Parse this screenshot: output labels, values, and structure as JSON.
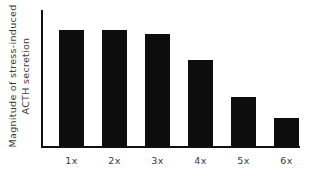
{
  "chart_data": {
    "type": "bar",
    "title": "",
    "subtitle": "",
    "xlabel": "",
    "ylabel": "Magnitude of stress-induced ACTH secretion",
    "ylabel_lines": [
      "Magnitude of stress-induced",
      "ACTH secretion"
    ],
    "categories": [
      "1x",
      "2x",
      "3x",
      "4x",
      "5x",
      "6x"
    ],
    "values": [
      100,
      100,
      96,
      74,
      42,
      24
    ],
    "ylim": [
      0,
      117
    ],
    "xlim_note": "categorical",
    "grid": false,
    "legend": null,
    "axis_ticks": {
      "y": [],
      "x": [
        "1x",
        "2x",
        "3x",
        "4x",
        "5x",
        "6x"
      ]
    },
    "annotations": [],
    "bar_color": "#0d0d0d",
    "axis_color": "#111111",
    "text_color": "#3a3a3a",
    "background_color": "#ffffff"
  }
}
